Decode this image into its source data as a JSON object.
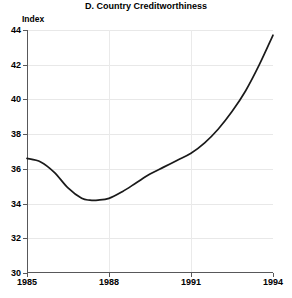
{
  "chart_data": {
    "type": "line",
    "title": "D. Country Creditworthiness",
    "xlabel": "",
    "ylabel": "Index",
    "ylim": [
      30,
      44
    ],
    "xlim": [
      1985,
      1994
    ],
    "grid": true,
    "legend": null,
    "y_ticks": [
      30,
      32,
      34,
      36,
      38,
      40,
      42,
      44
    ],
    "y_tick_labels": [
      "30",
      "32",
      "34",
      "36",
      "38",
      "40",
      "42",
      "44"
    ],
    "x_ticks": [
      1985,
      1988,
      1991,
      1994
    ],
    "x_tick_labels": [
      "1985",
      "1988",
      "1991",
      "1994"
    ],
    "x_gridlines": [
      1988,
      1991
    ],
    "series": [
      {
        "name": "Country Creditworthiness Index",
        "color": "#1a1a1a",
        "x": [
          1985.0,
          1985.5,
          1986.0,
          1986.5,
          1987.0,
          1987.3,
          1987.6,
          1988.0,
          1988.5,
          1989.0,
          1989.5,
          1990.0,
          1990.5,
          1991.0,
          1991.5,
          1992.0,
          1992.5,
          1993.0,
          1993.5,
          1994.0
        ],
        "values": [
          36.6,
          36.4,
          35.8,
          34.9,
          34.3,
          34.2,
          34.2,
          34.3,
          34.7,
          35.2,
          35.7,
          36.1,
          36.5,
          36.9,
          37.5,
          38.3,
          39.3,
          40.5,
          42.0,
          43.7
        ]
      }
    ]
  },
  "axis": {
    "y_label_text": "Index"
  }
}
